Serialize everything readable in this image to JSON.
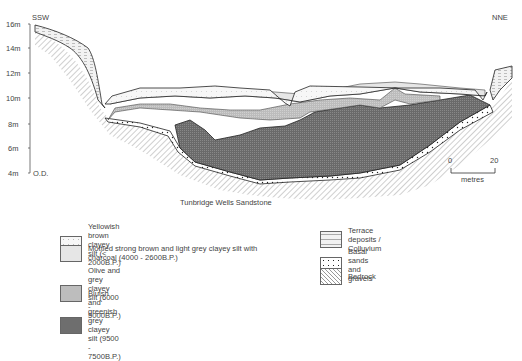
{
  "diagram": {
    "direction_left": "SSW",
    "direction_right": "NNE",
    "y_axis": {
      "ticks": [
        "16m",
        "14m",
        "12m",
        "10m",
        "8m",
        "6m",
        "4m"
      ],
      "datum_label": "O.D."
    },
    "bedrock_label": "Tunbridge Wells Sandstone",
    "scale_bar": {
      "start": "0",
      "end": "20",
      "unit": "metres"
    }
  },
  "legend": {
    "left": [
      {
        "label": "Yellowish brown clayey silt (< 2000B.P.)",
        "pattern": "sparse-dots"
      },
      {
        "label": "Mottled strong brown and light grey clayey silt with charcoal (4000 - 2600B.P.)",
        "pattern": "light-grey"
      },
      {
        "label": "Olive and grey clayey silt (6000 - 5000B.P.)",
        "pattern": "medium-grey"
      },
      {
        "label": "Bluish and greenish grey clayey silt (9500 - 7500B.P.)",
        "pattern": "dark-grey"
      }
    ],
    "right": [
      {
        "label": "Terrace deposits / Colluvium",
        "pattern": "dashes"
      },
      {
        "label": "Basal sands and gravels",
        "pattern": "dots"
      },
      {
        "label": "Bedrock",
        "pattern": "diagonal-hatch"
      }
    ]
  },
  "colors": {
    "yellowish": "#f4f4f4",
    "mottled": "#e6e6e6",
    "olive": "#bdbdbd",
    "bluish": "#6e6e6e",
    "line": "#222222"
  }
}
